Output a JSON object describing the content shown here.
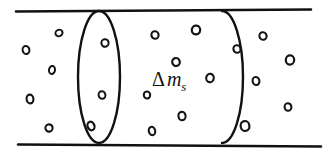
{
  "figure": {
    "kind": "physics-control-volume-diagram",
    "canvas": {
      "width": 330,
      "height": 154,
      "background": "#ffffff"
    },
    "ink_color": "#111111",
    "particle_color": "#141414"
  },
  "pipe": {
    "name": "pipe-duct",
    "top_wall": {
      "x1": 16,
      "y1": 11.5,
      "x2": 311,
      "y2": 9.5,
      "stroke_width": 2.6
    },
    "bottom_wall": {
      "x1": 18,
      "y1": 144.5,
      "x2": 321,
      "y2": 146.5,
      "stroke_width": 2.6
    }
  },
  "control_volume": {
    "name": "control-volume",
    "left_face": {
      "shape": "ellipse",
      "cx": 99,
      "cy": 77,
      "rx": 21,
      "ry": 66,
      "stroke_width": 2.4
    },
    "right_face": {
      "shape": "arc",
      "cx": 222,
      "cy": 77,
      "rx": 21,
      "ry": 66,
      "sweep": "right-half",
      "stroke_width": 2.4
    }
  },
  "label": {
    "name": "delta-mass-label",
    "text": "Δm_s",
    "delta": "Δ",
    "base": "m",
    "subscript": "s",
    "x": 152,
    "y": 86,
    "font_size": 20,
    "sub_font_size": 13
  },
  "particles": {
    "name": "fluid-particles",
    "legend": "small open circles representing fluid mass elements",
    "count": 21,
    "items": [
      {
        "region": "upstream",
        "cx": 26,
        "cy": 50,
        "rx": 3.4,
        "ry": 4.0,
        "rot": -12,
        "sw": 2.0
      },
      {
        "region": "upstream",
        "cx": 59,
        "cy": 33,
        "rx": 3.6,
        "ry": 3.2,
        "rot": -25,
        "sw": 2.0
      },
      {
        "region": "upstream",
        "cx": 52,
        "cy": 70,
        "rx": 3.0,
        "ry": 4.0,
        "rot": 8,
        "sw": 2.0
      },
      {
        "region": "upstream",
        "cx": 30,
        "cy": 99,
        "rx": 3.4,
        "ry": 4.4,
        "rot": -6,
        "sw": 2.1
      },
      {
        "region": "upstream",
        "cx": 49,
        "cy": 128,
        "rx": 3.6,
        "ry": 3.6,
        "rot": -18,
        "sw": 2.1
      },
      {
        "region": "left-face",
        "cx": 105,
        "cy": 43,
        "rx": 3.6,
        "ry": 3.8,
        "rot": -10,
        "sw": 2.0
      },
      {
        "region": "left-face",
        "cx": 102,
        "cy": 95,
        "rx": 3.4,
        "ry": 3.8,
        "rot": -14,
        "sw": 2.0
      },
      {
        "region": "left-face",
        "cx": 91,
        "cy": 126,
        "rx": 3.4,
        "ry": 4.4,
        "rot": -22,
        "sw": 2.2
      },
      {
        "region": "control-volume",
        "cx": 155,
        "cy": 35,
        "rx": 3.6,
        "ry": 3.8,
        "rot": -8,
        "sw": 2.1
      },
      {
        "region": "control-volume",
        "cx": 196,
        "cy": 30,
        "rx": 4.2,
        "ry": 4.4,
        "rot": 6,
        "sw": 2.2
      },
      {
        "region": "control-volume",
        "cx": 176,
        "cy": 62,
        "rx": 3.8,
        "ry": 4.0,
        "rot": -12,
        "sw": 2.2
      },
      {
        "region": "control-volume",
        "cx": 210,
        "cy": 78,
        "rx": 3.8,
        "ry": 4.2,
        "rot": 10,
        "sw": 2.1
      },
      {
        "region": "control-volume",
        "cx": 147,
        "cy": 95,
        "rx": 3.2,
        "ry": 3.6,
        "rot": -6,
        "sw": 2.0
      },
      {
        "region": "control-volume",
        "cx": 182,
        "cy": 116,
        "rx": 3.6,
        "ry": 4.2,
        "rot": -10,
        "sw": 2.1
      },
      {
        "region": "control-volume",
        "cx": 152,
        "cy": 131,
        "rx": 3.2,
        "ry": 4.2,
        "rot": -14,
        "sw": 2.1
      },
      {
        "region": "control-volume",
        "cx": 237,
        "cy": 49,
        "rx": 3.6,
        "ry": 3.8,
        "rot": -8,
        "sw": 2.1
      },
      {
        "region": "downstream",
        "cx": 263,
        "cy": 36,
        "rx": 3.6,
        "ry": 3.8,
        "rot": -14,
        "sw": 2.1
      },
      {
        "region": "downstream",
        "cx": 290,
        "cy": 60,
        "rx": 4.2,
        "ry": 4.6,
        "rot": 4,
        "sw": 2.2
      },
      {
        "region": "downstream",
        "cx": 256,
        "cy": 81,
        "rx": 3.4,
        "ry": 4.0,
        "rot": -10,
        "sw": 2.1
      },
      {
        "region": "downstream",
        "cx": 288,
        "cy": 107,
        "rx": 3.4,
        "ry": 3.8,
        "rot": -6,
        "sw": 2.1
      },
      {
        "region": "downstream",
        "cx": 245,
        "cy": 126,
        "rx": 4.4,
        "ry": 5.0,
        "rot": -8,
        "sw": 2.2
      }
    ]
  }
}
